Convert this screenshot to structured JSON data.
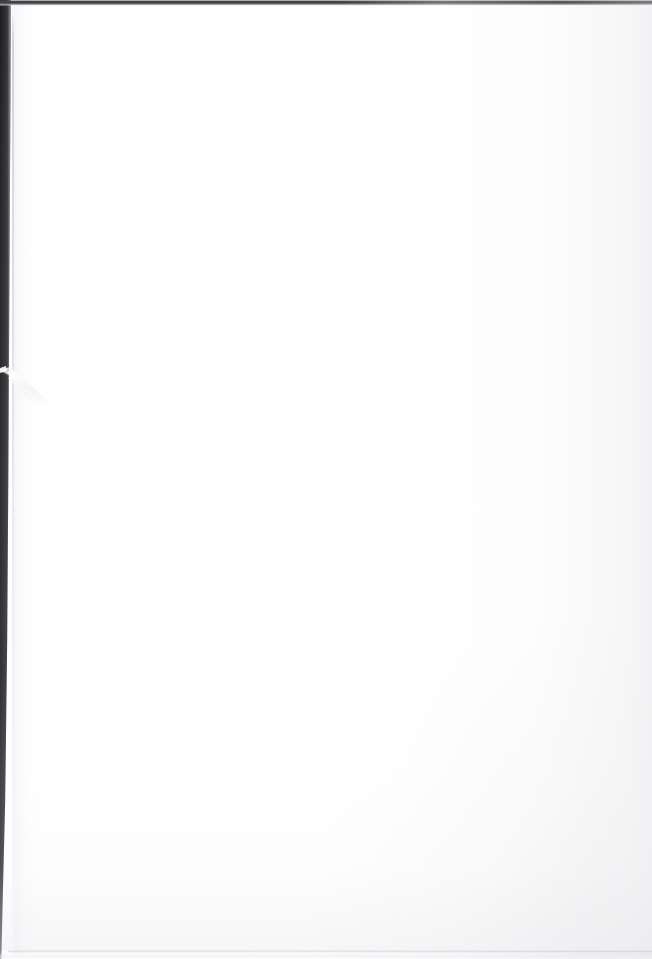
{
  "document": {
    "kind": "scanned-page",
    "page_state": "blank",
    "width": 652,
    "height": 959,
    "visible_text": "",
    "blank_note": ""
  },
  "colors": {
    "paper": "#ffffff",
    "paper_tint": "#f7f7f8",
    "scanner_background": "#2b2b2f",
    "top_edge_strip": "#3a3a3e",
    "paper_edge_line": "#c4c4ca",
    "bottom_shadow": "#c6c6cc",
    "crease_highlight": "#ffffff",
    "vignette": "#e2e2e4"
  },
  "artifacts": {
    "left_scanner_band": {
      "name": "left-scanner-band",
      "top_width_px": 11,
      "bottom_width_px": 2
    },
    "top_scanner_strip": {
      "name": "top-scanner-strip",
      "y_start_px": 1,
      "y_end_px": 5
    },
    "paper_edge_line": {
      "name": "paper-edge-line",
      "x_px": 13
    },
    "crease_fold": {
      "name": "crease-fold-streak",
      "x_px": 0,
      "y_px": 372,
      "width_px": 60,
      "height_px": 40
    },
    "bottom_shadow_line": {
      "name": "bottom-shadow-line",
      "y_px": 951
    }
  }
}
